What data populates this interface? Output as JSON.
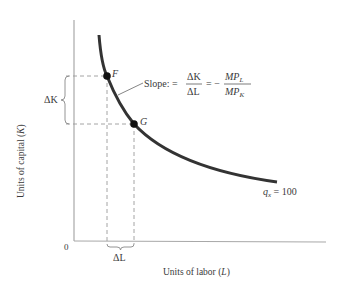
{
  "diagram": {
    "type": "isoquant",
    "axes": {
      "x_label": "Units of labor",
      "x_var": "L",
      "y_label": "Units of capital",
      "y_var": "K",
      "origin": "0"
    },
    "curve": {
      "label_var": "q",
      "label_sub": "x",
      "label_eq": " = 100"
    },
    "points": [
      {
        "name": "F"
      },
      {
        "name": "G"
      }
    ],
    "annotations": {
      "delta_k": "ΔK",
      "delta_l": "ΔL",
      "slope_prefix": "Slope: =",
      "slope_frac_num": "ΔK",
      "slope_frac_den": "ΔL",
      "slope_eq": "= −",
      "mp_num": "MP",
      "mp_num_sub": "L",
      "mp_den": "MP",
      "mp_den_sub": "K"
    },
    "colors": {
      "axis": "#a0a0a0",
      "curve": "#333333",
      "dash": "#9a9a9a",
      "text": "#3a3a3a"
    }
  }
}
